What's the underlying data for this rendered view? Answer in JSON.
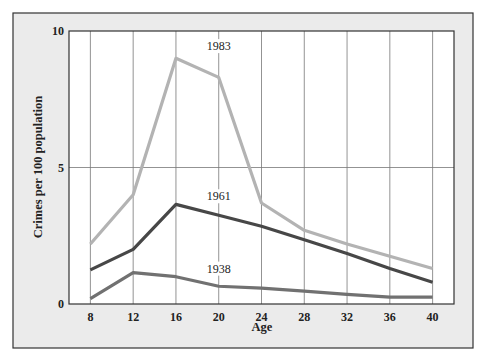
{
  "chart_data": {
    "type": "line",
    "title": "",
    "xlabel": "Age",
    "ylabel": "Crimes per 100 population",
    "x": [
      8,
      12,
      16,
      20,
      24,
      28,
      32,
      36,
      40
    ],
    "xlim": [
      6,
      42
    ],
    "ylim": [
      0,
      10
    ],
    "x_ticks": [
      "8",
      "12",
      "16",
      "20",
      "24",
      "28",
      "32",
      "36",
      "40"
    ],
    "y_ticks": [
      "0",
      "5",
      "10"
    ],
    "grid": {
      "vertical": true,
      "horizontal_at": [
        5
      ]
    },
    "legend": "inline labels",
    "series": [
      {
        "name": "1983",
        "color": "#b3b3b3",
        "values": [
          2.2,
          4.0,
          9.0,
          8.3,
          3.7,
          2.7,
          2.2,
          1.75,
          1.3
        ]
      },
      {
        "name": "1961",
        "color": "#474747",
        "values": [
          1.25,
          2.0,
          3.65,
          3.25,
          2.85,
          2.35,
          1.85,
          1.3,
          0.8
        ]
      },
      {
        "name": "1938",
        "color": "#717171",
        "values": [
          0.2,
          1.15,
          1.0,
          0.65,
          0.58,
          0.47,
          0.35,
          0.25,
          0.25
        ]
      }
    ],
    "annotations": [
      {
        "text": "1983",
        "x": 20,
        "y": 9.3
      },
      {
        "text": "1961",
        "x": 20,
        "y": 3.8
      },
      {
        "text": "1938",
        "x": 20,
        "y": 1.15
      }
    ]
  },
  "style": {
    "panel_background": "#ebebeb",
    "plot_background": "#ffffff",
    "frame_color": "#333333",
    "grid_color": "#777777"
  }
}
